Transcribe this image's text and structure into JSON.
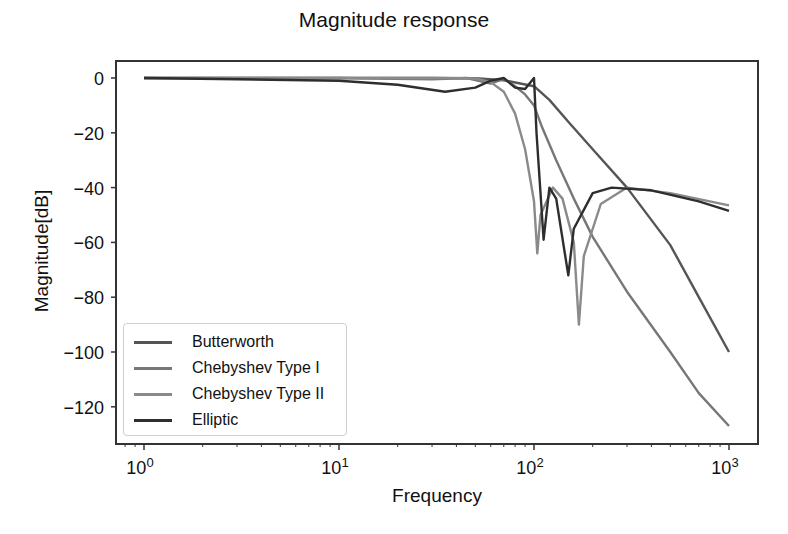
{
  "chart_data": {
    "type": "line",
    "title": "Magnitude response",
    "xlabel": "Frequency",
    "ylabel": "Magnitude[dB]",
    "xscale": "log",
    "xlim": [
      0.75,
      1300
    ],
    "ylim": [
      -133,
      7
    ],
    "xticks": [
      {
        "base": "10",
        "exp": "0",
        "value": 1
      },
      {
        "base": "10",
        "exp": "1",
        "value": 10
      },
      {
        "base": "10",
        "exp": "2",
        "value": 100
      },
      {
        "base": "10",
        "exp": "3",
        "value": 1000
      }
    ],
    "yticks": [
      0,
      -20,
      -40,
      -60,
      -80,
      -100,
      -120
    ],
    "grid": false,
    "legend_position": "lower left",
    "series": [
      {
        "name": "Butterworth",
        "color": "#555555",
        "points": [
          [
            1,
            0
          ],
          [
            10,
            0
          ],
          [
            30,
            0
          ],
          [
            50,
            -0.1
          ],
          [
            70,
            -0.8
          ],
          [
            85,
            -2
          ],
          [
            100,
            -3
          ],
          [
            120,
            -8
          ],
          [
            150,
            -16
          ],
          [
            200,
            -26
          ],
          [
            300,
            -40
          ],
          [
            500,
            -61
          ],
          [
            700,
            -80
          ],
          [
            1000,
            -100
          ]
        ]
      },
      {
        "name": "Chebyshev Type I",
        "color": "#777777",
        "points": [
          [
            1,
            0
          ],
          [
            10,
            0
          ],
          [
            30,
            -0.5
          ],
          [
            45,
            0
          ],
          [
            60,
            -2
          ],
          [
            70,
            -0.3
          ],
          [
            80,
            -3
          ],
          [
            90,
            -6
          ],
          [
            100,
            -10
          ],
          [
            110,
            -18
          ],
          [
            130,
            -30
          ],
          [
            160,
            -44
          ],
          [
            200,
            -58
          ],
          [
            300,
            -78
          ],
          [
            500,
            -100
          ],
          [
            700,
            -115
          ],
          [
            1000,
            -127
          ]
        ]
      },
      {
        "name": "Chebyshev Type II",
        "color": "#8a8a8a",
        "points": [
          [
            1,
            0
          ],
          [
            10,
            0
          ],
          [
            30,
            0
          ],
          [
            50,
            -0.2
          ],
          [
            60,
            -1.5
          ],
          [
            70,
            -5
          ],
          [
            80,
            -13
          ],
          [
            90,
            -26
          ],
          [
            100,
            -45
          ],
          [
            104,
            -64
          ],
          [
            108,
            -50
          ],
          [
            125,
            -40
          ],
          [
            140,
            -44
          ],
          [
            160,
            -60
          ],
          [
            170,
            -90
          ],
          [
            180,
            -65
          ],
          [
            220,
            -46
          ],
          [
            300,
            -40
          ],
          [
            500,
            -42
          ],
          [
            1000,
            -46.5
          ]
        ]
      },
      {
        "name": "Elliptic",
        "color": "#2e2e2e",
        "points": [
          [
            1,
            0
          ],
          [
            10,
            -1
          ],
          [
            20,
            -2.5
          ],
          [
            35,
            -5
          ],
          [
            50,
            -3.5
          ],
          [
            60,
            -1
          ],
          [
            70,
            0
          ],
          [
            80,
            -3.5
          ],
          [
            90,
            -4
          ],
          [
            100,
            0
          ],
          [
            103,
            -20
          ],
          [
            112,
            -59
          ],
          [
            120,
            -40
          ],
          [
            130,
            -44
          ],
          [
            150,
            -72
          ],
          [
            160,
            -55
          ],
          [
            200,
            -42
          ],
          [
            250,
            -40
          ],
          [
            400,
            -41
          ],
          [
            700,
            -45
          ],
          [
            1000,
            -48.5
          ]
        ]
      }
    ]
  },
  "legend": {
    "items": [
      {
        "label": "Butterworth",
        "color": "#555555"
      },
      {
        "label": "Chebyshev Type I",
        "color": "#777777"
      },
      {
        "label": "Chebyshev Type II",
        "color": "#8a8a8a"
      },
      {
        "label": "Elliptic",
        "color": "#2e2e2e"
      }
    ]
  }
}
